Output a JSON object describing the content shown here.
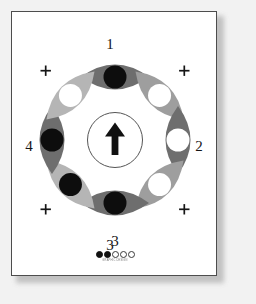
{
  "card": {
    "background_color": "#ffffff",
    "border_color": "#4d4d4d",
    "page_background": "#f2f2f2"
  },
  "wheel": {
    "center_arrow": {
      "direction": "up",
      "icon": "arrow-up-icon",
      "circle_outline_color": "#555555"
    },
    "position_labels": [
      {
        "id": "1",
        "label": "1",
        "placement": "top"
      },
      {
        "id": "2",
        "label": "2",
        "placement": "right"
      },
      {
        "id": "3",
        "label": "3",
        "placement": "bottom"
      },
      {
        "id": "4",
        "label": "4",
        "placement": "left"
      }
    ],
    "tick_marks": {
      "glyph": "+",
      "count": 4,
      "color": "#151515",
      "placements": [
        "upper-left",
        "upper-right",
        "lower-left",
        "lower-right"
      ]
    },
    "segments": [
      {
        "index": 0,
        "angle": 0,
        "name": "segment-top",
        "petal_color": "#6e6e6e",
        "dot_color": "#0d0d0d",
        "dot_state": "filled"
      },
      {
        "index": 1,
        "angle": 45,
        "name": "segment-upper-right",
        "petal_color": "#9e9e9e",
        "dot_color": "#ffffff",
        "dot_state": "open"
      },
      {
        "index": 2,
        "angle": 90,
        "name": "segment-right",
        "petal_color": "#6e6e6e",
        "dot_color": "#ffffff",
        "dot_state": "open"
      },
      {
        "index": 3,
        "angle": 135,
        "name": "segment-lower-right",
        "petal_color": "#9e9e9e",
        "dot_color": "#ffffff",
        "dot_state": "open"
      },
      {
        "index": 4,
        "angle": 180,
        "name": "segment-bottom",
        "petal_color": "#6e6e6e",
        "dot_color": "#0d0d0d",
        "dot_state": "filled"
      },
      {
        "index": 5,
        "angle": 225,
        "name": "segment-lower-left",
        "petal_color": "#b5b5b5",
        "dot_color": "#0d0d0d",
        "dot_state": "filled"
      },
      {
        "index": 6,
        "angle": 270,
        "name": "segment-left",
        "petal_color": "#6e6e6e",
        "dot_color": "#0d0d0d",
        "dot_state": "filled"
      },
      {
        "index": 7,
        "angle": 315,
        "name": "segment-upper-left",
        "petal_color": "#b5b5b5",
        "dot_color": "#ffffff",
        "dot_state": "open"
      }
    ]
  },
  "footer": {
    "number": "3",
    "progress_dots": [
      {
        "state": "filled"
      },
      {
        "state": "filled"
      },
      {
        "state": "open"
      },
      {
        "state": "open"
      },
      {
        "state": "open"
      }
    ],
    "brand_text": "GRAPHIC DESIGN"
  }
}
